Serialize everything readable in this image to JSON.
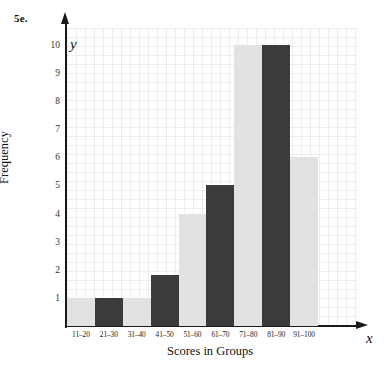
{
  "figure": {
    "problem_label": "5e."
  },
  "chart_data": {
    "type": "bar",
    "title": "",
    "xlabel": "Scores in Groups",
    "ylabel": "Frequency",
    "x_axis_letter": "x",
    "y_axis_letter": "y",
    "categories": [
      "11–20",
      "21–30",
      "31–40",
      "41–50",
      "51–60",
      "61–70",
      "71–80",
      "81–90",
      "91–100"
    ],
    "values": [
      1,
      1,
      1,
      1.8,
      4,
      5,
      10,
      10,
      6
    ],
    "bar_colors": [
      "light",
      "dark",
      "light",
      "dark",
      "light",
      "dark",
      "light",
      "dark",
      "light"
    ],
    "ylim": [
      0,
      10.6
    ],
    "yticks": [
      1,
      2,
      3,
      4,
      5,
      6,
      7,
      8,
      9,
      10
    ],
    "ytick_labels": [
      "1",
      "2",
      "3",
      "4",
      "5",
      "6",
      "7",
      "8",
      "9",
      "10"
    ],
    "grid": true,
    "legend": null,
    "colors": {
      "light_bar": "#e2e2e2",
      "dark_bar": "#3b3b3b",
      "axis": "#1a1a1a",
      "grid": "#aab0c4",
      "background": "#ffffff"
    }
  }
}
